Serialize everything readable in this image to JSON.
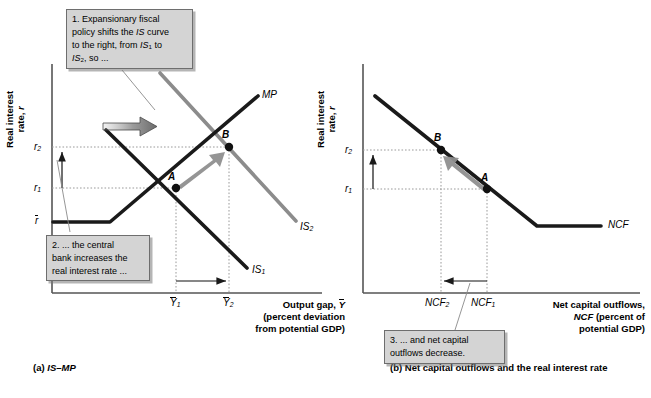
{
  "figure": {
    "panel_a": {
      "caption": "(a) IS–MP",
      "y_axis_label": "Real interest rate, r",
      "x_axis_title_line1": "Output gap, Ỹ",
      "x_axis_title_line2": "(percent deviation",
      "x_axis_title_line3": "from potential GDP)",
      "y_ticks": [
        "r2",
        "r1",
        "r̄"
      ],
      "x_ticks": [
        "Ỹ1",
        "Ỹ2"
      ],
      "curves": [
        {
          "name": "MP",
          "label": "MP",
          "color": "#1a1a1a"
        },
        {
          "name": "IS1",
          "label": "IS1",
          "color": "#1a1a1a"
        },
        {
          "name": "IS2",
          "label": "IS2",
          "color": "#8c8c8c"
        }
      ],
      "points": [
        {
          "label": "A",
          "x_tick": "Ỹ1",
          "y_tick": "r1"
        },
        {
          "label": "B",
          "x_tick": "Ỹ2",
          "y_tick": "r2"
        }
      ]
    },
    "panel_b": {
      "caption": "(b) Net capital outflows and the real interest rate",
      "y_axis_label": "Real interest rate, r",
      "x_axis_title_line1": "Net capital outflows,",
      "x_axis_title_line2": "NCF (percent of",
      "x_axis_title_line3": "potential GDP)",
      "y_ticks": [
        "r2",
        "r1"
      ],
      "x_ticks": [
        "NCF2",
        "NCF1"
      ],
      "curves": [
        {
          "name": "NCF",
          "label": "NCF",
          "color": "#1a1a1a"
        }
      ],
      "points": [
        {
          "label": "B",
          "x_tick": "NCF2",
          "y_tick": "r2"
        },
        {
          "label": "A",
          "x_tick": "NCF1",
          "y_tick": "r1"
        }
      ]
    },
    "callouts": [
      {
        "id": "callout-1",
        "number": "1.",
        "text_plain": "1. Expansionary fiscal policy shifts the IS curve to the right, from IS1 to IS2, so ..."
      },
      {
        "id": "callout-2",
        "number": "2.",
        "text_plain": "2. ... the central bank increases the real interest rate ..."
      },
      {
        "id": "callout-3",
        "number": "3.",
        "text_plain": "3. ... and net capital outflows decrease."
      }
    ],
    "colors": {
      "curve_black": "#1a1a1a",
      "curve_gray": "#8c8c8c",
      "callout_fill": "#d4d4d4",
      "callout_border": "#6e6e6e",
      "axis": "#555555",
      "dotted_guide": "#9a9a9a"
    }
  }
}
